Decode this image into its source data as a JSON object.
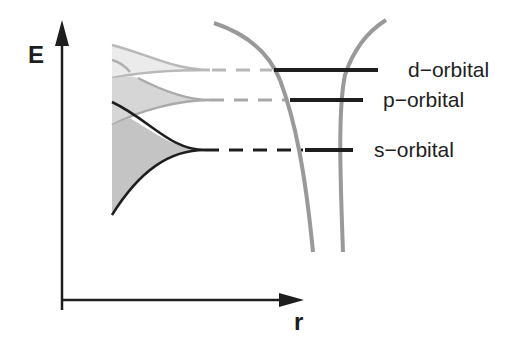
{
  "diagram": {
    "axes": {
      "y_label": "E",
      "x_label": "r"
    },
    "levels": [
      {
        "name": "d-orbital",
        "label": "d−orbital",
        "y": 70,
        "dash_color": "#b4b4b4",
        "fan_color": "#e6e6e6",
        "stroke": "#b4b4b4"
      },
      {
        "name": "p-orbital",
        "label": "p−orbital",
        "y": 100,
        "dash_color": "#a8a8a8",
        "fan_color": "#d2d2d2",
        "stroke": "#a8a8a8"
      },
      {
        "name": "s-orbital",
        "label": "s−orbital",
        "y": 150,
        "dash_color": "#1e1e1e",
        "fan_color": "#c0c0c0",
        "stroke": "#1e1e1e"
      }
    ],
    "colors": {
      "axis": "#1e1e1e",
      "well": "#999999",
      "level": "#1e1e1e"
    }
  }
}
